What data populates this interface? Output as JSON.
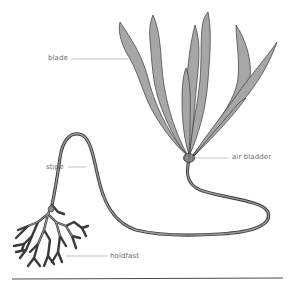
{
  "diagram": {
    "labels": {
      "blade": "blade",
      "stipe": "stipe",
      "air_bladder": "air bladder",
      "holdfast": "holdfast"
    },
    "colors": {
      "blade_fill": "#a6a6a6",
      "outline": "#3a3a3a",
      "stipe_fill": "#8c8c8c",
      "leader_line": "#9a9a9a",
      "label_text": "#6a6a6a",
      "ground_line": "#4a4a4a",
      "background": "#ffffff"
    }
  }
}
